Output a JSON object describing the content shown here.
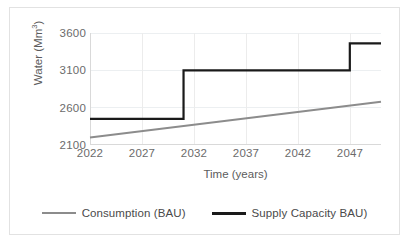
{
  "chart_data": {
    "type": "line",
    "title": "",
    "xlabel": "Time (years)",
    "ylabel": "Water (Mm³)",
    "ylabel_base": "Water (Mm",
    "ylabel_sup": "3",
    "ylabel_close": ")",
    "xlim": [
      2022,
      2050
    ],
    "ylim": [
      2100,
      3600
    ],
    "xticks": [
      2022,
      2027,
      2032,
      2037,
      2042,
      2047
    ],
    "yticks": [
      2100,
      2600,
      3100,
      3600
    ],
    "grid": "horizontal-and-vertical",
    "legend_position": "bottom-center",
    "series": [
      {
        "name": "Consumption (BAU)",
        "type": "line",
        "color": "#8c8c8c",
        "width": 2.0,
        "x": [
          2022,
          2050
        ],
        "values": [
          2200,
          2680
        ]
      },
      {
        "name": "Supply Capacity BAU)",
        "type": "step",
        "color": "#1a1a1a",
        "width": 2.2,
        "x": [
          2022,
          2031,
          2031,
          2047,
          2047,
          2050
        ],
        "values": [
          2450,
          2450,
          3100,
          3100,
          3460,
          3460
        ],
        "steps": [
          {
            "from_year": 2022,
            "to_year": 2031,
            "level": 2450
          },
          {
            "from_year": 2031,
            "to_year": 2047,
            "level": 3100
          },
          {
            "from_year": 2047,
            "to_year": 2050,
            "level": 3460
          }
        ]
      }
    ]
  },
  "legend": {
    "items": [
      {
        "label": "Consumption (BAU)",
        "color": "#8c8c8c",
        "width": "2px"
      },
      {
        "label": "Supply Capacity BAU)",
        "color": "#1a1a1a",
        "width": "3px"
      }
    ]
  },
  "colors": {
    "consumption": "#8c8c8c",
    "supply": "#1a1a1a",
    "grid": "#eceff1",
    "axis": "#d9d9d9",
    "border": "#e2e2e2",
    "tick_text": "#6b6b6b",
    "axis_title": "#5c5c5c"
  }
}
